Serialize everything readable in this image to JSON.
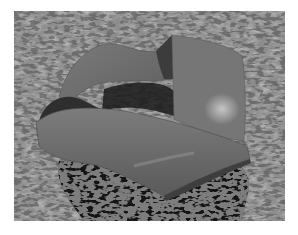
{
  "image": {
    "subject": "rendered translucent twisted ribbon surface over textured stone ground",
    "colors": {
      "background": "#ffffff",
      "ground": "#8f8f8f",
      "ground_dark": "#5a5a5a",
      "shadow": "#1a1a1a",
      "ribbon": "#6e6e6e",
      "ribbon_light": "#8a8a8a",
      "ribbon_dark": "#3a3a3a",
      "highlight": "#c8c8c8"
    }
  }
}
